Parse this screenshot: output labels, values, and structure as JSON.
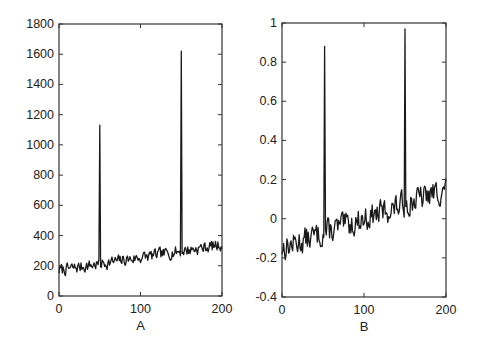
{
  "figure": {
    "background": "#ffffff",
    "line_color": "#1a1a1a",
    "axis_color": "#333333"
  },
  "chart_data": [
    {
      "type": "line",
      "panel": "A",
      "title": "",
      "xlabel": "A",
      "ylabel": "",
      "xlim": [
        0,
        200
      ],
      "ylim": [
        0,
        1800
      ],
      "xticks": [
        0,
        100,
        200
      ],
      "yticks": [
        0,
        200,
        400,
        600,
        800,
        1000,
        1200,
        1400,
        1600,
        1800
      ],
      "grid": false,
      "legend": null,
      "frame": {
        "left": 59,
        "right": 222,
        "top": 24,
        "bottom": 296
      },
      "baseline": {
        "start": 170,
        "end": 340,
        "noise": 55,
        "seed": 7
      },
      "spikes": [
        {
          "x": 50,
          "y": 1130
        },
        {
          "x": 150,
          "y": 1620
        }
      ],
      "description": "Noisy signal of 200 samples trending from ~170 to ~340 with two sharp spikes at x=50 (~1130) and x=150 (~1620)"
    },
    {
      "type": "line",
      "panel": "B",
      "title": "",
      "xlabel": "B",
      "ylabel": "",
      "xlim": [
        0,
        200
      ],
      "ylim": [
        -0.4,
        1
      ],
      "xticks": [
        0,
        100,
        200
      ],
      "yticks": [
        -0.4,
        -0.2,
        0,
        0.2,
        0.4,
        0.6,
        0.8,
        1
      ],
      "grid": false,
      "legend": null,
      "frame": {
        "left": 282,
        "right": 446,
        "top": 23,
        "bottom": 297
      },
      "baseline": {
        "start": -0.15,
        "end": 0.15,
        "noise": 0.09,
        "seed": 13
      },
      "spikes": [
        {
          "x": 52,
          "y": 0.88
        },
        {
          "x": 150,
          "y": 0.97
        }
      ],
      "description": "Noisy normalized signal of 200 samples trending from ~-0.15 to ~0.15 with two sharp spikes at x≈52 (~0.88) and x=150 (~0.97)"
    }
  ]
}
